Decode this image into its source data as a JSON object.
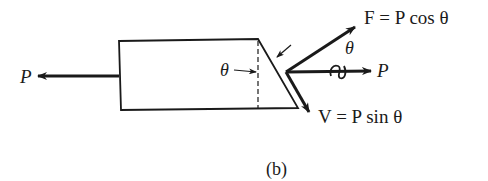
{
  "figure": {
    "caption": "(b)",
    "colors": {
      "stroke": "#1a1a1a",
      "background": "#ffffff"
    }
  },
  "labels": {
    "p_left": "P",
    "p_right": "P",
    "theta_inner": "θ",
    "theta_outer": "θ",
    "f_equation": "F = P cos θ",
    "v_equation": "V = P sin θ"
  },
  "elements": {
    "body": "trapezoidal bar cut at angle θ",
    "forces": [
      "P (left, axial)",
      "P (right, axial)",
      "F = P cos θ (normal)",
      "V = P sin θ (shear)"
    ]
  }
}
